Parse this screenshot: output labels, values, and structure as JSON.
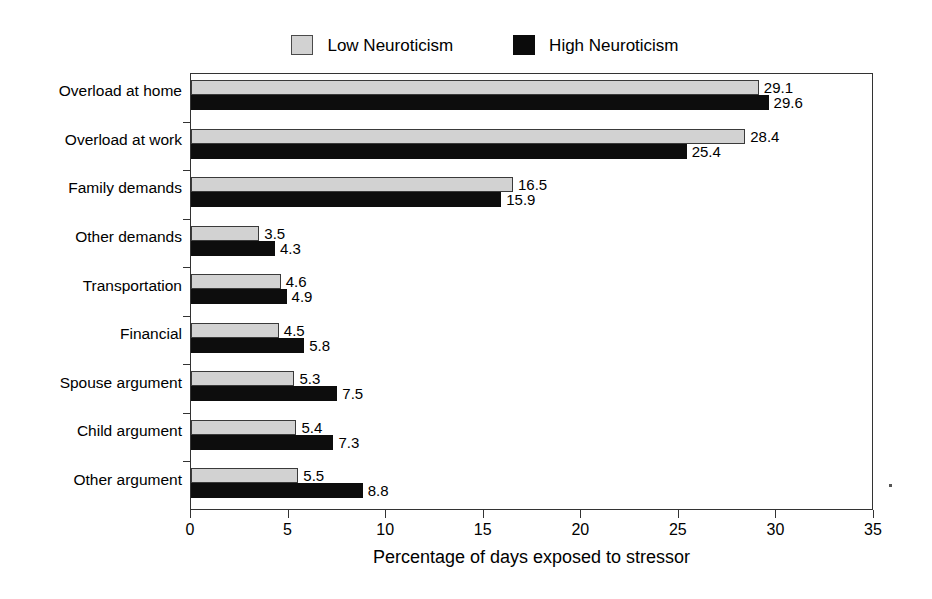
{
  "chart_data": {
    "type": "bar",
    "orientation": "horizontal",
    "title": "",
    "xlabel": "Percentage of days exposed to stressor",
    "ylabel": "",
    "xlim": [
      0,
      35
    ],
    "xticks": [
      0,
      5,
      10,
      15,
      20,
      25,
      30,
      35
    ],
    "grid": false,
    "legend_position": "top-center",
    "categories": [
      "Overload at home",
      "Overload at work",
      "Family demands",
      "Other demands",
      "Transportation",
      "Financial",
      "Spouse argument",
      "Child argument",
      "Other argument"
    ],
    "series": [
      {
        "name": "Low Neuroticism",
        "color": "#d2d2d2",
        "values": [
          29.1,
          28.4,
          16.5,
          3.5,
          4.6,
          4.5,
          5.3,
          5.4,
          5.5
        ]
      },
      {
        "name": "High Neuroticism",
        "color": "#0d0d0d",
        "values": [
          29.6,
          25.4,
          15.9,
          4.3,
          4.9,
          5.8,
          7.5,
          7.3,
          8.8
        ]
      }
    ]
  },
  "legend": {
    "entries": [
      {
        "label": "Low Neuroticism",
        "swatch": "low-neuroticism-swatch"
      },
      {
        "label": "High Neuroticism",
        "swatch": "high-neuroticism-swatch"
      }
    ]
  },
  "axis": {
    "x_title": "Percentage of days exposed to stressor",
    "x_tick_labels": [
      "0",
      "5",
      "10",
      "15",
      "20",
      "25",
      "30",
      "35"
    ]
  }
}
